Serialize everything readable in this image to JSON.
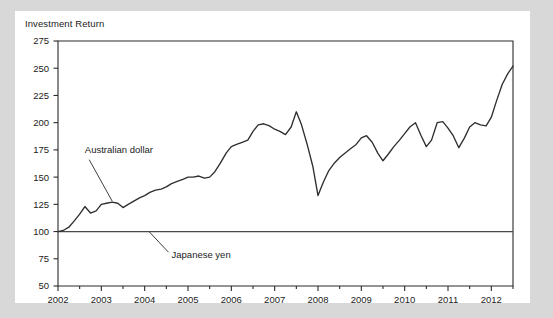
{
  "chart_data": {
    "type": "line",
    "title": "Investment Return",
    "xlabel": "",
    "ylabel": "",
    "ylim": [
      50,
      275
    ],
    "xlim": [
      2002,
      2012.5
    ],
    "yticks": [
      50,
      75,
      100,
      125,
      150,
      175,
      200,
      225,
      250,
      275
    ],
    "xticks": [
      2002,
      2003,
      2004,
      2005,
      2006,
      2007,
      2008,
      2009,
      2010,
      2011,
      2012
    ],
    "grid": false,
    "legend_position": "inline-annotations",
    "annotations": [
      {
        "name": "australian-dollar-annotation",
        "label": "Australian dollar",
        "label_x": 2002.62,
        "label_y": 172,
        "leader_from_x": 2002.72,
        "leader_from_y": 166,
        "leader_to_x": 2003.25,
        "leader_to_y": 128
      },
      {
        "name": "japanese-yen-annotation",
        "label": "Japanese yen",
        "label_x": 2004.62,
        "label_y": 76,
        "leader_from_x": 2004.55,
        "leader_from_y": 81,
        "leader_to_x": 2004.1,
        "leader_to_y": 100
      }
    ],
    "series": [
      {
        "name": "Australian dollar",
        "color": "#2f2f2f",
        "x": [
          2002.0,
          2002.12,
          2002.25,
          2002.38,
          2002.5,
          2002.62,
          2002.75,
          2002.88,
          2003.0,
          2003.12,
          2003.25,
          2003.38,
          2003.5,
          2003.62,
          2003.75,
          2003.88,
          2004.0,
          2004.12,
          2004.25,
          2004.38,
          2004.5,
          2004.62,
          2004.75,
          2004.88,
          2005.0,
          2005.12,
          2005.25,
          2005.38,
          2005.5,
          2005.62,
          2005.75,
          2005.88,
          2006.0,
          2006.12,
          2006.25,
          2006.38,
          2006.5,
          2006.62,
          2006.75,
          2006.88,
          2007.0,
          2007.12,
          2007.25,
          2007.38,
          2007.5,
          2007.62,
          2007.75,
          2007.88,
          2008.0,
          2008.12,
          2008.25,
          2008.38,
          2008.5,
          2008.62,
          2008.75,
          2008.88,
          2009.0,
          2009.12,
          2009.25,
          2009.38,
          2009.5,
          2009.62,
          2009.75,
          2009.88,
          2010.0,
          2010.12,
          2010.25,
          2010.38,
          2010.5,
          2010.62,
          2010.75,
          2010.88,
          2011.0,
          2011.12,
          2011.25,
          2011.38,
          2011.5,
          2011.62,
          2011.75,
          2011.88,
          2012.0,
          2012.12,
          2012.25,
          2012.38,
          2012.5
        ],
        "values": [
          100,
          101,
          104,
          110,
          116,
          123,
          117,
          119,
          125,
          126,
          127,
          126,
          122,
          125,
          128,
          131,
          133,
          136,
          138,
          139,
          141,
          144,
          146,
          148,
          150,
          150,
          151,
          149,
          150,
          155,
          163,
          172,
          178,
          180,
          182,
          184,
          192,
          198,
          199,
          197,
          194,
          192,
          189,
          196,
          210,
          198,
          180,
          160,
          133,
          145,
          156,
          163,
          168,
          172,
          176,
          180,
          186,
          188,
          182,
          172,
          165,
          171,
          178,
          184,
          190,
          196,
          200,
          188,
          178,
          184,
          200,
          201,
          195,
          188,
          177,
          186,
          196,
          200,
          198,
          197,
          205,
          220,
          235,
          245,
          252
        ]
      },
      {
        "name": "Japanese yen",
        "color": "#4a4a4a",
        "x": [
          2002.0,
          2012.5
        ],
        "values": [
          100,
          100
        ]
      }
    ]
  }
}
